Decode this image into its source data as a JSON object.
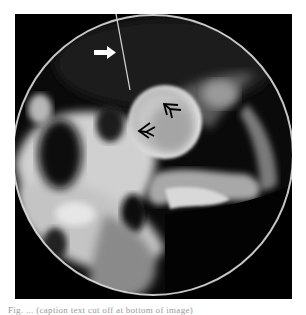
{
  "figure": {
    "type": "radiograph",
    "field_of_view": "circular",
    "annotations": [
      {
        "kind": "solid-arrow",
        "color": "#ffffff",
        "direction": "right"
      },
      {
        "kind": "open-arrowhead",
        "color": "#000000",
        "direction": "up-left"
      },
      {
        "kind": "open-arrowhead",
        "color": "#000000",
        "direction": "left"
      }
    ]
  },
  "caption": {
    "text": "Fig. ... (caption text cut off at bottom of image)"
  }
}
